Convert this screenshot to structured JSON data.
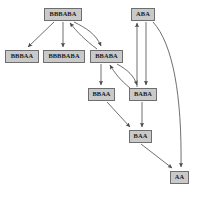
{
  "diagram": {
    "kind": "directed-graph",
    "background": "#ffffff",
    "node_fill": "#c9c9c9",
    "node_border": "#6e6e6e",
    "edge_color": "#555555",
    "text_color": "#1a1a1a",
    "nodes": [
      {
        "id": "n0",
        "label": "BBBABA",
        "x": 44,
        "y": 8,
        "w": 38,
        "h": 13,
        "font": 6.4
      },
      {
        "id": "n1",
        "label": "ABA",
        "x": 131,
        "y": 8,
        "w": 24,
        "h": 13,
        "font": 6.4
      },
      {
        "id": "n2",
        "label": "BBBAA",
        "x": 5,
        "y": 50,
        "w": 34,
        "h": 13,
        "font": 6.4
      },
      {
        "id": "n3",
        "label": "BBBBABA",
        "x": 43,
        "y": 50,
        "w": 42,
        "h": 13,
        "font": 6.4
      },
      {
        "id": "n4",
        "label": "BBABA",
        "x": 90,
        "y": 50,
        "w": 33,
        "h": 13,
        "font": 6.4
      },
      {
        "id": "n5",
        "label": "BBAA",
        "x": 88,
        "y": 88,
        "w": 27,
        "h": 13,
        "font": 6.4
      },
      {
        "id": "n6",
        "label": "BABA",
        "x": 129,
        "y": 88,
        "w": 28,
        "h": 13,
        "font": 6.4
      },
      {
        "id": "n7",
        "label": "BAA",
        "x": 129,
        "y": 130,
        "w": 23,
        "h": 13,
        "font": 6.4
      },
      {
        "id": "n8",
        "label": "AA",
        "x": 170,
        "y": 171,
        "w": 19,
        "h": 13,
        "font": 6.4
      }
    ],
    "edges": [
      {
        "from": "BBBABA",
        "to": "BBBAA",
        "style": "straight"
      },
      {
        "from": "BBBABA",
        "to": "BBBBABA",
        "style": "straight"
      },
      {
        "from": "BBBABA",
        "to": "BBABA",
        "style": "curved"
      },
      {
        "from": "BBABA",
        "to": "BBBABA",
        "style": "curved"
      },
      {
        "from": "BBABA",
        "to": "BBAA",
        "style": "straight"
      },
      {
        "from": "BBABA",
        "to": "BABA",
        "style": "curved"
      },
      {
        "from": "BABA",
        "to": "BBABA",
        "style": "curved"
      },
      {
        "from": "ABA",
        "to": "BABA",
        "style": "straight"
      },
      {
        "from": "BABA",
        "to": "ABA",
        "style": "straight"
      },
      {
        "from": "BBAA",
        "to": "BAA",
        "style": "straight"
      },
      {
        "from": "BABA",
        "to": "BAA",
        "style": "straight"
      },
      {
        "from": "BAA",
        "to": "AA",
        "style": "straight"
      },
      {
        "from": "ABA",
        "to": "AA",
        "style": "curved"
      }
    ]
  }
}
